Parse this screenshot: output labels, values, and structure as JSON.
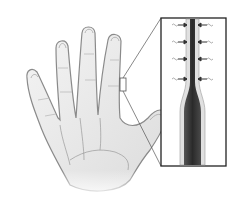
{
  "figure": {
    "hand": {
      "side": "palm",
      "fingers": 5
    },
    "callout": {
      "source": "right-index-finger-side",
      "target": "inset-panel"
    },
    "inset": {
      "content": "tapered-vessel-with-arrows",
      "arrow_rows": 4,
      "arrow_direction": "inward"
    },
    "colors": {
      "background": "#ffffff",
      "skin_fill": "#ededed",
      "skin_outline": "#8a8a8a",
      "vessel_dark": "#3a3a3a",
      "inset_border": "#222222"
    }
  }
}
